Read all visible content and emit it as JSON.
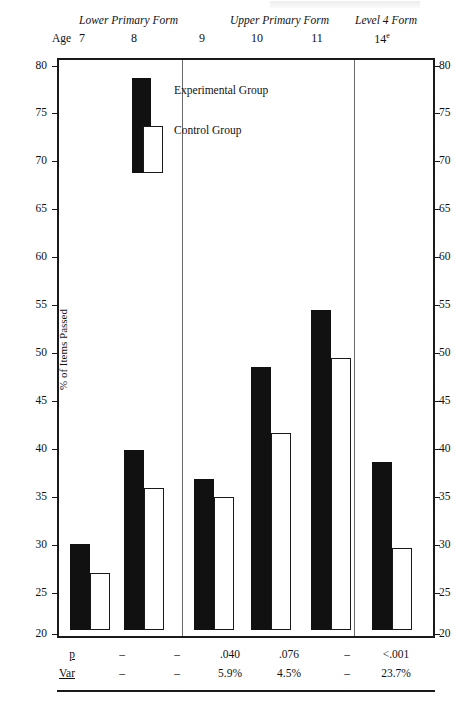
{
  "chart_data": {
    "type": "bar",
    "title": "",
    "xlabel": "Age",
    "ylabel": "% of Items Passed",
    "ylim": [
      20,
      80
    ],
    "ytick_step": 5,
    "yticks": [
      20,
      25,
      30,
      35,
      40,
      45,
      50,
      55,
      60,
      65,
      70,
      75,
      80
    ],
    "grid": false,
    "legend_position": "top-left-inside",
    "categories": [
      "7",
      "8",
      "9",
      "10",
      "11",
      "14"
    ],
    "category_superscripts": [
      "",
      "",
      "",
      "",
      "",
      "e"
    ],
    "series": [
      {
        "name": "Experimental Group",
        "color": "#111111",
        "values": [
          29.1,
          39.0,
          36.0,
          47.8,
          53.8,
          37.8
        ]
      },
      {
        "name": "Control Group",
        "color": "#ffffff",
        "values": [
          26.0,
          35.0,
          34.0,
          40.8,
          48.7,
          28.7
        ]
      }
    ],
    "group_bands": [
      {
        "label": "Lower Primary Form",
        "categories": [
          "7",
          "8"
        ]
      },
      {
        "label": "Upper Primary Form",
        "categories": [
          "9",
          "10",
          "11"
        ]
      },
      {
        "label": "Level 4 Form",
        "categories": [
          "14"
        ]
      }
    ],
    "annotations": {
      "rows": [
        {
          "key": "p",
          "label": "p",
          "values": [
            "–",
            "–",
            ".040",
            ".076",
            "–",
            "<.001"
          ]
        },
        {
          "key": "var",
          "label": "Var",
          "values": [
            "–",
            "–",
            "5.9%",
            "4.5%",
            "–",
            "23.7%"
          ]
        }
      ]
    }
  },
  "axes": {
    "y_title": "% of Items Passed",
    "age_label": "Age",
    "left_ticks": [
      "80",
      "75",
      "70",
      "65",
      "60",
      "55",
      "50",
      "45",
      "40",
      "35",
      "30",
      "25",
      "20"
    ],
    "right_ticks": [
      "80",
      "75",
      "70",
      "65",
      "60",
      "55",
      "50",
      "45",
      "40",
      "35",
      "30",
      "25",
      "20"
    ]
  },
  "header": {
    "bands": [
      "Lower Primary Form",
      "Upper Primary Form",
      "Level 4 Form"
    ],
    "ages": [
      "7",
      "8",
      "9",
      "10",
      "11",
      "14"
    ],
    "age_sup": "e"
  },
  "legend": {
    "experimental": "Experimental Group",
    "control": "Control Group"
  },
  "colors": {
    "experimental": "#111111",
    "control": "#ffffff",
    "axis": "#1a1a1a",
    "divider": "#6a6a6a",
    "background": "#ffffff"
  }
}
